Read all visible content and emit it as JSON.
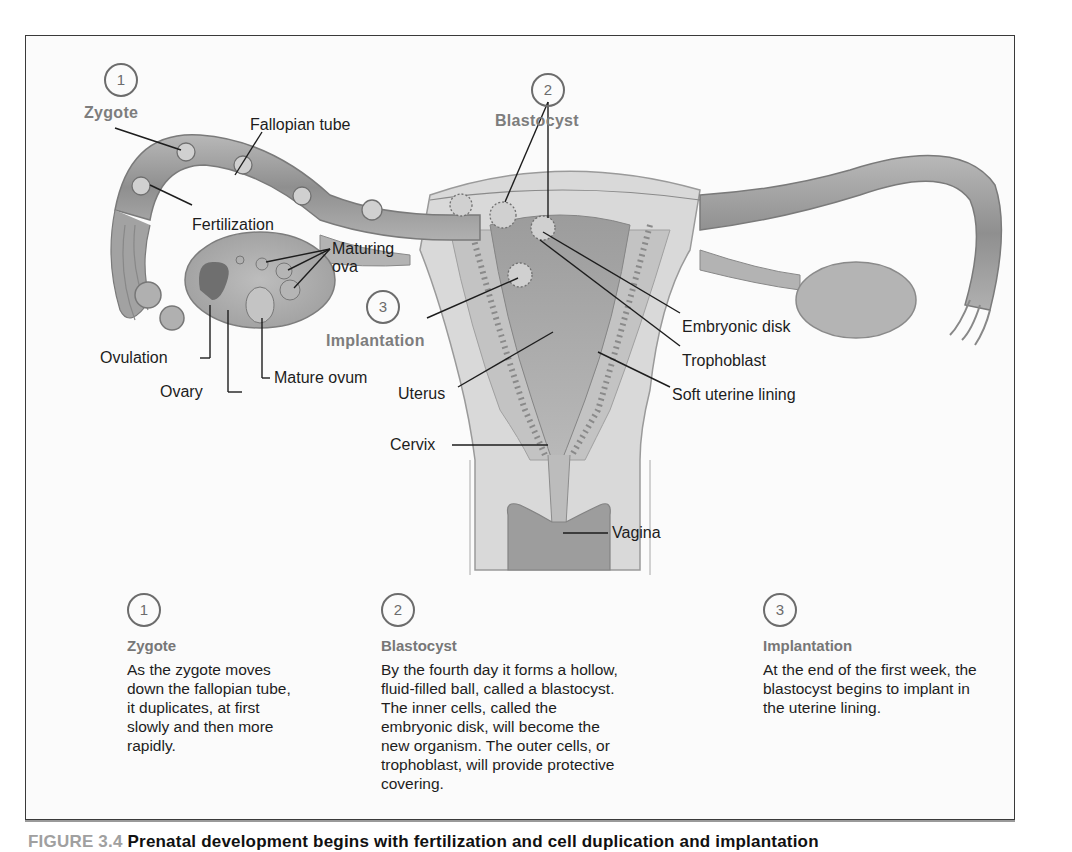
{
  "figure": {
    "anatomy_labels": {
      "zygote": "Zygote",
      "fallopian_tube": "Fallopian tube",
      "fertilization": "Fertilization",
      "maturing_ova_1": "Maturing",
      "maturing_ova_2": "ova",
      "ovulation": "Ovulation",
      "ovary": "Ovary",
      "mature_ovum": "Mature ovum",
      "implantation": "Implantation",
      "blastocyst": "Blastocyst",
      "uterus": "Uterus",
      "cervix": "Cervix",
      "vagina": "Vagina",
      "embryonic_disk": "Embryonic disk",
      "trophoblast": "Trophoblast",
      "soft_uterine_lining": "Soft uterine lining"
    },
    "step_markers": [
      {
        "number": "1",
        "label": "Zygote"
      },
      {
        "number": "2",
        "label": "Blastocyst"
      },
      {
        "number": "3",
        "label": "Implantation"
      }
    ],
    "steps": [
      {
        "number": "1",
        "title": "Zygote",
        "body": "As the zygote moves down the fallopian tube, it duplicates, at first slowly and then more rapidly."
      },
      {
        "number": "2",
        "title": "Blastocyst",
        "body": "By the fourth day it forms a hollow, fluid-filled ball, called a blastocyst. The inner cells, called the embryonic disk, will become the new organism. The outer cells, or trophoblast, will provide protective covering."
      },
      {
        "number": "3",
        "title": "Implantation",
        "body": "At the end of the first week, the blastocyst begins to implant in the uterine lining."
      }
    ],
    "caption": {
      "figure_label": "FIGURE 3.4",
      "text": "Prenatal development begins with fertilization and cell duplication and implantation"
    },
    "colors": {
      "tissue_light": "#d4d4d4",
      "tissue_mid": "#a9a9a9",
      "tissue_dark": "#7e7e7e",
      "step_label_gray": "#7d7d7d",
      "frame_border": "#3a3a3a"
    }
  }
}
